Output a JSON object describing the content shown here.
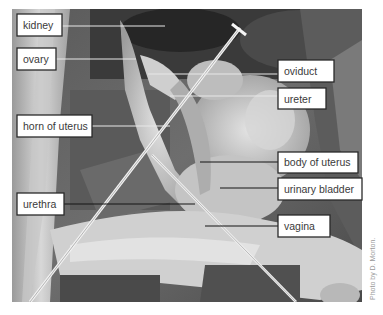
{
  "figure": {
    "labels": [
      {
        "id": "kidney",
        "text": "kidney"
      },
      {
        "id": "ovary",
        "text": "ovary"
      },
      {
        "id": "oviduct",
        "text": "oviduct"
      },
      {
        "id": "ureter",
        "text": "ureter"
      },
      {
        "id": "horn-of-uterus",
        "text": "horn of uterus"
      },
      {
        "id": "body-of-uterus",
        "text": "body of uterus"
      },
      {
        "id": "urinary-bladder",
        "text": "urinary bladder"
      },
      {
        "id": "urethra",
        "text": "urethra"
      },
      {
        "id": "vagina",
        "text": "vagina"
      }
    ],
    "credit": "Photo by D. Morton."
  }
}
